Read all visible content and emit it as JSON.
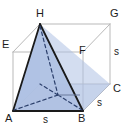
{
  "figure": {
    "colors": {
      "pyramid_fill": "#aec1e3",
      "pyramid_edge": "#1a1a1a",
      "cube_edge": "#b5b5b5",
      "hidden_edge": "#2b3f6b",
      "label_color": "#1c1c1c",
      "background": "#ffffff"
    },
    "vertices": [
      {
        "name": "H",
        "label": "H",
        "x": 39,
        "y": 13,
        "role": "apex-top-back-left"
      },
      {
        "name": "G",
        "label": "G",
        "x": 113,
        "y": 13,
        "role": "top-back-right"
      },
      {
        "name": "E",
        "label": "E",
        "x": 4,
        "y": 44,
        "role": "top-front-left"
      },
      {
        "name": "F",
        "label": "F",
        "x": 81,
        "y": 50,
        "role": "top-front-right"
      },
      {
        "name": "C",
        "label": "C",
        "x": 115,
        "y": 88,
        "role": "bottom-back-right"
      },
      {
        "name": "A",
        "label": "A",
        "x": 8,
        "y": 117,
        "role": "bottom-front-left"
      },
      {
        "name": "B",
        "label": "B",
        "x": 81,
        "y": 117,
        "role": "bottom-front-right"
      }
    ],
    "edge_labels": [
      {
        "name": "edge-length-bottom-front",
        "label": "s",
        "x": 44,
        "y": 118
      },
      {
        "name": "edge-length-bottom-right",
        "label": "s",
        "x": 99,
        "y": 102
      },
      {
        "name": "edge-length-vertical-right",
        "label": "s",
        "x": 113,
        "y": 50
      }
    ]
  }
}
